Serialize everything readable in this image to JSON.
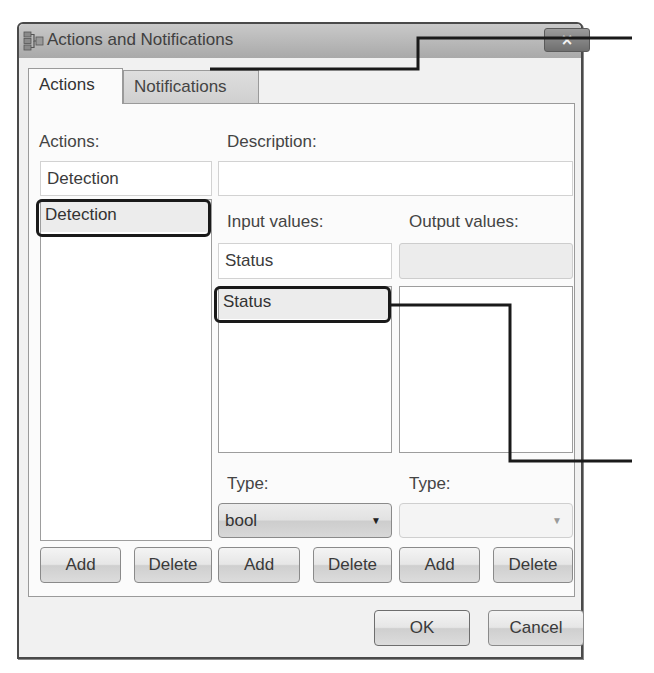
{
  "window": {
    "title": "Actions and Notifications",
    "close_icon": "×"
  },
  "tabs": [
    {
      "label": "Actions",
      "active": true
    },
    {
      "label": "Notifications",
      "active": false
    }
  ],
  "actions": {
    "label": "Actions:",
    "input_value": "Detection",
    "list": [
      "Detection"
    ],
    "selected_index": 0,
    "add_label": "Add",
    "delete_label": "Delete"
  },
  "description": {
    "label": "Description:",
    "value": ""
  },
  "input_values": {
    "label": "Input values:",
    "input_value": "Status",
    "list": [
      "Status"
    ],
    "selected_index": 0,
    "type_label": "Type:",
    "type_value": "bool",
    "add_label": "Add",
    "delete_label": "Delete"
  },
  "output_values": {
    "label": "Output values:",
    "input_value": "",
    "list": [],
    "type_label": "Type:",
    "type_value": "",
    "add_label": "Add",
    "delete_label": "Delete"
  },
  "dialog_buttons": {
    "ok_label": "OK",
    "cancel_label": "Cancel"
  },
  "icons": {
    "window_icon": "actions-notifications-icon",
    "dropdown_arrow": "▼"
  }
}
